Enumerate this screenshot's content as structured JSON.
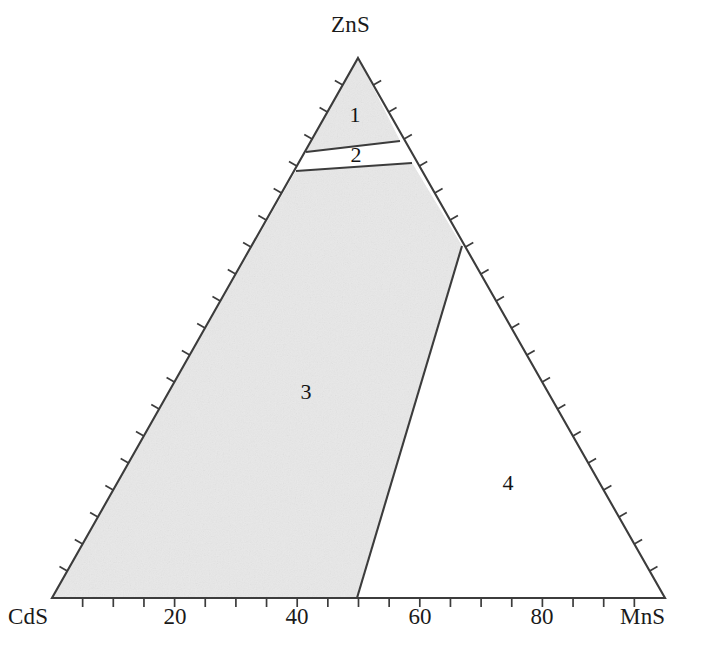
{
  "chart_data": {
    "type": "ternary-phase-diagram",
    "title": "",
    "subtitle": "",
    "xlabel": "",
    "ylabel": "",
    "grid": false,
    "legend_position": "none",
    "vertices": [
      {
        "name": "zns-apex",
        "label": "ZnS",
        "x": 358,
        "y": 58,
        "label_x": 331,
        "label_y": 12
      },
      {
        "name": "cds-left",
        "label": "CdS",
        "x": 52,
        "y": 598,
        "label_x": 8,
        "label_y": 604
      },
      {
        "name": "mns-right",
        "label": "MnS",
        "x": 665,
        "y": 598,
        "label_x": 620,
        "label_y": 604
      }
    ],
    "axis": {
      "bottom_tick_labels": [
        "20",
        "40",
        "60",
        "80"
      ],
      "bottom_tick_values": [
        20,
        40,
        60,
        80
      ],
      "bottom_tick_x": [
        175,
        297,
        420,
        542
      ],
      "bottom_tick_label_y": 604,
      "tick_interval_percent": 5,
      "tick_count_per_edge": 20,
      "range": [
        0,
        100
      ]
    },
    "regions": [
      {
        "id": 1,
        "label": "1",
        "label_x": 355,
        "label_y": 115,
        "shaded": true,
        "description": "apex field adjoining ZnS"
      },
      {
        "id": 2,
        "label": "2",
        "label_x": 356,
        "label_y": 155,
        "shaded": false,
        "description": "narrow white two-phase band"
      },
      {
        "id": 3,
        "label": "3",
        "label_x": 306,
        "label_y": 392,
        "shaded": true,
        "description": "large shaded field toward CdS"
      },
      {
        "id": 4,
        "label": "4",
        "label_x": 508,
        "label_y": 483,
        "shaded": false,
        "description": "white field toward MnS"
      }
    ],
    "boundaries": [
      {
        "name": "region1-region2-upper",
        "from": [
          306,
          152
        ],
        "to": [
          400,
          141
        ]
      },
      {
        "name": "region2-region3-lower",
        "from": [
          296,
          171
        ],
        "to": [
          412,
          163
        ]
      },
      {
        "name": "region3-region4",
        "from": [
          357,
          598
        ],
        "to": [
          462,
          246
        ]
      }
    ],
    "colors": {
      "shading": "#e8e8e8",
      "outline": "#3c3c3c",
      "text": "#1a1a1a",
      "background": "#ffffff"
    }
  }
}
